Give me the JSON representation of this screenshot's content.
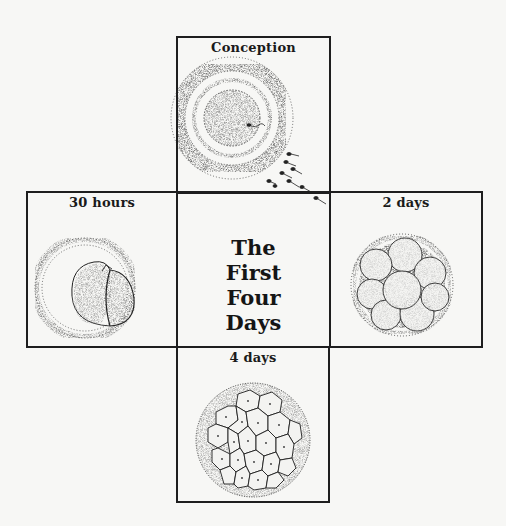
{
  "diagram": {
    "center_title": {
      "lines": [
        "The",
        "First",
        "Four",
        "Days"
      ]
    },
    "stages": [
      {
        "id": "conception",
        "label": "Conception",
        "position": "top",
        "illustration": "egg-with-sperm-icon"
      },
      {
        "id": "30-hours",
        "label": "30 hours",
        "position": "left",
        "illustration": "two-cell-embryo-icon"
      },
      {
        "id": "2-days",
        "label": "2 days",
        "position": "right",
        "illustration": "eight-cell-embryo-icon"
      },
      {
        "id": "4-days",
        "label": "4 days",
        "position": "bottom",
        "illustration": "morula-icon"
      }
    ],
    "colors": {
      "line": "#1e1e1e",
      "background": "#f7f7f5",
      "stipple": "#2a2a2a"
    }
  }
}
